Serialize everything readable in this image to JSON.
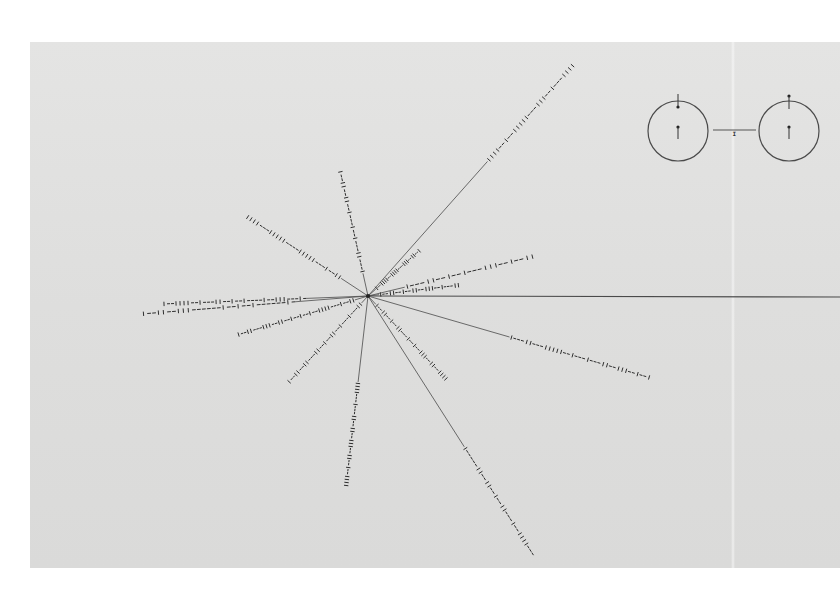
{
  "colors": {
    "background": "#ffffff",
    "plate": "#dfdfde",
    "line": "#4a4a4a",
    "mark": "#2e2e2e"
  },
  "pulsar_map": {
    "center": [
      368,
      296
    ],
    "lines": [
      {
        "name": "galactic-center-line",
        "end": [
          840,
          297
        ],
        "dash_from": null,
        "code": ""
      },
      {
        "name": "pulsar-line-ne-long",
        "end": [
          574,
          64
        ],
        "dash_from": 0.58,
        "code": "IIII--I--IIIII---III--I---IIII"
      },
      {
        "name": "pulsar-line-n-1",
        "end": [
          340,
          170
        ],
        "dash_from": 0.18,
        "code": "I---II---I--I---I--II--II--I"
      },
      {
        "name": "pulsar-line-n-2",
        "end": [
          420,
          250
        ],
        "dash_from": 0.15,
        "code": "I--IIII--IIII---III--II--I"
      },
      {
        "name": "pulsar-line-ne-2",
        "end": [
          460,
          285
        ],
        "dash_from": 0.12,
        "code": "I--II--I--II--III--I---II"
      },
      {
        "name": "pulsar-line-e-1",
        "end": [
          535,
          256
        ],
        "dash_from": 0.22,
        "code": "I---II--I--I---III--I--II"
      },
      {
        "name": "pulsar-line-nw-1",
        "end": [
          246,
          216
        ],
        "dash_from": 0.22,
        "code": "II--I---IIIII----IIIII---IIII"
      },
      {
        "name": "pulsar-line-w-1",
        "end": [
          162,
          304
        ],
        "dash_from": 0.3,
        "code": "-I---III--I----I--I--II---I--IIII--I"
      },
      {
        "name": "pulsar-line-w-2",
        "end": [
          141,
          314
        ],
        "dash_from": 0.32,
        "code": "-I------I--I--I------III--II--I"
      },
      {
        "name": "pulsar-line-sw-1",
        "end": [
          237,
          335
        ],
        "dash_from": 0.1,
        "code": "II--I---IIII--I--I--I--II--III---II--I"
      },
      {
        "name": "pulsar-line-sw-2",
        "end": [
          288,
          383
        ],
        "dash_from": 0.08,
        "code": "II---I---I--II--I--II---II--II--I"
      },
      {
        "name": "pulsar-line-s-1",
        "end": [
          346,
          487
        ],
        "dash_from": 0.45,
        "code": "IIII---I---II--II--III--II--I--IIII"
      },
      {
        "name": "pulsar-line-se-1",
        "end": [
          447,
          380
        ],
        "dash_from": 0.1,
        "code": "I--II--I--II---I--I--III--II--IIII"
      },
      {
        "name": "pulsar-line-se-long",
        "end": [
          534,
          556
        ],
        "dash_from": 0.58,
        "code": "I-----II--II--I--II---I--IIII---"
      },
      {
        "name": "pulsar-line-ese",
        "end": [
          651,
          378
        ],
        "dash_from": 0.5,
        "code": "I---II---IIIII--I---I---II--III--I--I"
      }
    ]
  },
  "hydrogen_diagram": {
    "left_circle": {
      "center": [
        678,
        131
      ],
      "radius": 30
    },
    "right_circle": {
      "center": [
        789,
        131
      ],
      "radius": 30
    },
    "connector": {
      "from": [
        713,
        130
      ],
      "to": [
        756,
        130
      ],
      "tick_label": "I"
    }
  }
}
